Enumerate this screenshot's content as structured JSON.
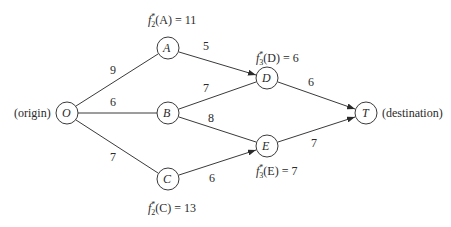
{
  "diagram": {
    "type": "network-shortest-path",
    "nodes": [
      {
        "id": "O",
        "label": "O",
        "x": 67,
        "y": 113
      },
      {
        "id": "A",
        "label": "A",
        "x": 168,
        "y": 48
      },
      {
        "id": "B",
        "label": "B",
        "x": 168,
        "y": 113
      },
      {
        "id": "C",
        "label": "C",
        "x": 168,
        "y": 179
      },
      {
        "id": "D",
        "label": "D",
        "x": 267,
        "y": 78
      },
      {
        "id": "E",
        "label": "E",
        "x": 267,
        "y": 146
      },
      {
        "id": "T",
        "label": "T",
        "x": 366,
        "y": 113
      }
    ],
    "edges": [
      {
        "from": "O",
        "to": "A",
        "weight": "9",
        "arrow": false
      },
      {
        "from": "O",
        "to": "B",
        "weight": "6",
        "arrow": false
      },
      {
        "from": "O",
        "to": "C",
        "weight": "7",
        "arrow": false
      },
      {
        "from": "A",
        "to": "D",
        "weight": "5",
        "arrow": true
      },
      {
        "from": "B",
        "to": "D",
        "weight": "7",
        "arrow": false
      },
      {
        "from": "B",
        "to": "E",
        "weight": "8",
        "arrow": false
      },
      {
        "from": "C",
        "to": "E",
        "weight": "6",
        "arrow": true
      },
      {
        "from": "D",
        "to": "T",
        "weight": "6",
        "arrow": true
      },
      {
        "from": "E",
        "to": "T",
        "weight": "7",
        "arrow": true
      }
    ],
    "side_labels": {
      "origin": "(origin)",
      "destination": "(destination)"
    },
    "annotations": {
      "A": {
        "f": "f",
        "sub": "2",
        "sup": "*",
        "arg": "(A) = 11"
      },
      "C": {
        "f": "f",
        "sub": "2",
        "sup": "*",
        "arg": "(C) = 13"
      },
      "D": {
        "f": "f",
        "sub": "3",
        "sup": "*",
        "arg": "(D) = 6"
      },
      "E": {
        "f": "f",
        "sub": "3",
        "sup": "*",
        "arg": "(E) = 7"
      }
    },
    "weights": {
      "OA": "9",
      "OB": "6",
      "OC": "7",
      "AD": "5",
      "BD": "7",
      "BE": "8",
      "CE": "6",
      "DT": "6",
      "ET": "7"
    }
  }
}
